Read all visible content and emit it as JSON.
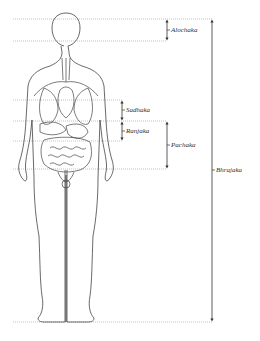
{
  "diagram": {
    "type": "anatomical-body-regions",
    "colors": {
      "line": "#444444",
      "dotted": "#9a9a9a",
      "text": "#333333",
      "background": "#ffffff"
    },
    "regions": [
      {
        "id": "alochaka",
        "label": "Alochaka",
        "top_y": 19,
        "bottom_y": 41,
        "arrow_x": 167
      },
      {
        "id": "sadhaka",
        "label": "Sadhaka",
        "top_y": 100,
        "bottom_y": 121,
        "arrow_x": 122
      },
      {
        "id": "ranjaka",
        "label": "Ranjaka",
        "top_y": 121,
        "bottom_y": 141,
        "arrow_x": 122
      },
      {
        "id": "pachaka",
        "label": "Pachaka",
        "top_y": 121,
        "bottom_y": 169,
        "arrow_x": 167
      },
      {
        "id": "bhrajaka",
        "label": "Bhrajaka",
        "top_y": 19,
        "bottom_y": 322,
        "arrow_x": 212
      }
    ]
  }
}
